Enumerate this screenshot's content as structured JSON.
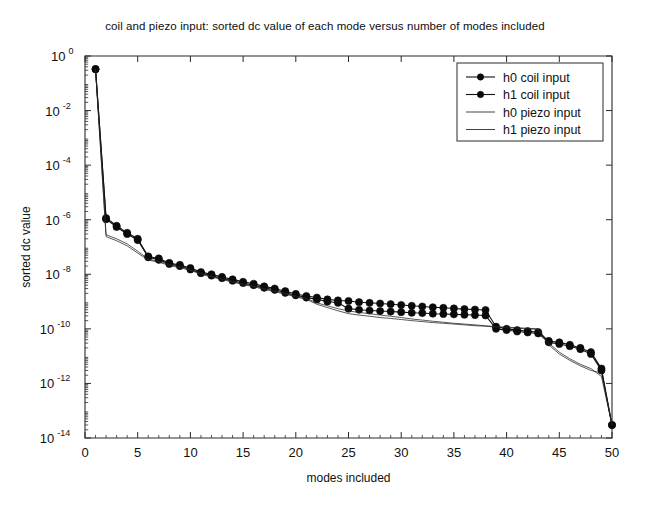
{
  "chart_data": {
    "type": "line",
    "title": "coil and piezo input:  sorted dc value of each mode versus number of modes included",
    "xlabel": "modes included",
    "ylabel": "sorted dc value",
    "xscale": "linear",
    "yscale": "log",
    "xlim": [
      0,
      50
    ],
    "ylim": [
      1e-14,
      1
    ],
    "grid": false,
    "legend_position": "upper-right",
    "xticks": [
      0,
      5,
      10,
      15,
      20,
      25,
      30,
      35,
      40,
      45,
      50
    ],
    "xticklabels": [
      "0",
      "5",
      "10",
      "15",
      "20",
      "25",
      "30",
      "35",
      "40",
      "45",
      "50"
    ],
    "yticks": [
      1,
      0.01,
      0.0001,
      1e-06,
      1e-08,
      1e-10,
      1e-12,
      1e-14
    ],
    "yticklabels": [
      "10^0",
      "10^-2",
      "10^-4",
      "10^-6",
      "10^-8",
      "10^-10",
      "10^-12",
      "10^-14"
    ],
    "ytick_mantissa": [
      "10",
      "10",
      "10",
      "10",
      "10",
      "10",
      "10",
      "10"
    ],
    "ytick_exponent": [
      "0",
      "-2",
      "-4",
      "-6",
      "-8",
      "-10",
      "-12",
      "-14"
    ],
    "x": [
      1,
      2,
      3,
      4,
      5,
      6,
      7,
      8,
      9,
      10,
      11,
      12,
      13,
      14,
      15,
      16,
      17,
      18,
      19,
      20,
      21,
      22,
      23,
      24,
      25,
      26,
      27,
      28,
      29,
      30,
      31,
      32,
      33,
      34,
      35,
      36,
      37,
      38,
      39,
      40,
      41,
      42,
      43,
      44,
      45,
      46,
      47,
      48,
      49,
      50
    ],
    "series": [
      {
        "name": "h0 coil input",
        "marker": "filled-circle",
        "linestyle": "solid",
        "values": [
          0.33,
          1.15e-06,
          6e-07,
          3.3e-07,
          2e-07,
          4.5e-08,
          3.8e-08,
          2.6e-08,
          2.2e-08,
          1.7e-08,
          1.2e-08,
          1e-08,
          8e-09,
          6.5e-09,
          5.3e-09,
          4.5e-09,
          3.6e-09,
          3e-09,
          2.4e-09,
          1.9e-09,
          1.6e-09,
          1.4e-09,
          1.2e-09,
          1.1e-09,
          1.05e-09,
          9.5e-10,
          9e-10,
          8.5e-10,
          8e-10,
          7.5e-10,
          7e-10,
          6.6e-10,
          6.2e-10,
          5.9e-10,
          5.6e-10,
          5.3e-10,
          5.1e-10,
          4.9e-10,
          1.2e-10,
          1e-10,
          9e-11,
          8.2e-11,
          7.6e-11,
          3.6e-11,
          3.2e-11,
          2.6e-11,
          2e-11,
          1.4e-11,
          3.5e-12,
          3e-14
        ]
      },
      {
        "name": "h1 coil input",
        "marker": "filled-circle",
        "linestyle": "solid",
        "values": [
          0.33,
          1.05e-06,
          5.4e-07,
          3e-07,
          1.8e-07,
          4.2e-08,
          3.4e-08,
          2.4e-08,
          2e-08,
          1.5e-08,
          1.1e-08,
          9e-09,
          7.2e-09,
          5.8e-09,
          4.8e-09,
          4e-09,
          3.2e-09,
          2.7e-09,
          2.1e-09,
          1.7e-09,
          1.4e-09,
          1.2e-09,
          1e-09,
          9e-10,
          5.5e-10,
          5e-10,
          4.7e-10,
          4.5e-10,
          4.3e-10,
          4.1e-10,
          3.9e-10,
          3.8e-10,
          3.6e-10,
          3.5e-10,
          3.4e-10,
          3.3e-10,
          3.2e-10,
          3.1e-10,
          1e-10,
          9e-11,
          8e-11,
          7.4e-11,
          6.8e-11,
          3.2e-11,
          2.8e-11,
          2.3e-11,
          1.8e-11,
          1.2e-11,
          3e-12,
          3e-14
        ]
      },
      {
        "name": "h0 piezo input",
        "marker": "none",
        "linestyle": "solid",
        "values": [
          0.33,
          2.8e-07,
          2e-07,
          1.3e-07,
          7e-08,
          3.6e-08,
          3e-08,
          2.3e-08,
          1.9e-08,
          1.5e-08,
          1.1e-08,
          8.5e-09,
          6.8e-09,
          5.5e-09,
          4.4e-09,
          3.7e-09,
          3e-09,
          2.5e-09,
          2e-09,
          1.6e-09,
          1.3e-09,
          9e-10,
          7e-10,
          5.5e-10,
          4.5e-10,
          4e-10,
          3.6e-10,
          3.2e-10,
          2.9e-10,
          2.6e-10,
          2.3e-10,
          2.1e-10,
          1.9e-10,
          1.75e-10,
          1.6e-10,
          1.5e-10,
          1.4e-10,
          1.3e-10,
          1.2e-10,
          1.15e-10,
          1.1e-10,
          1.05e-10,
          1e-10,
          3e-11,
          1.4e-11,
          8e-12,
          5e-12,
          3.5e-12,
          1.8e-12,
          3e-14
        ]
      },
      {
        "name": "h1 piezo input",
        "marker": "none",
        "linestyle": "solid",
        "values": [
          0.33,
          2.4e-07,
          1.7e-07,
          1.1e-07,
          6e-08,
          3.3e-08,
          2.8e-08,
          2.1e-08,
          1.75e-08,
          1.4e-08,
          1e-08,
          8e-09,
          6.4e-09,
          5.2e-09,
          4.2e-09,
          3.5e-09,
          2.8e-09,
          2.3e-09,
          1.85e-09,
          1.5e-09,
          1.2e-09,
          8e-10,
          6e-10,
          4.6e-10,
          3.6e-10,
          3.2e-10,
          2.9e-10,
          2.6e-10,
          2.4e-10,
          2.2e-10,
          2e-10,
          1.85e-10,
          1.7e-10,
          1.6e-10,
          1.5e-10,
          1.4e-10,
          1.3e-10,
          1.25e-10,
          1.15e-10,
          1.1e-10,
          1.05e-10,
          1e-10,
          9.5e-11,
          2.6e-11,
          1.2e-11,
          7e-12,
          4.4e-12,
          3e-12,
          2.4e-12,
          3e-14
        ]
      }
    ],
    "legend": [
      {
        "label": "h0 coil input",
        "marker": "filled-circle",
        "linestyle": "solid"
      },
      {
        "label": "h1 coil input",
        "marker": "filled-circle",
        "linestyle": "solid"
      },
      {
        "label": "h0 piezo input",
        "marker": "none",
        "linestyle": "solid"
      },
      {
        "label": "h1 piezo input",
        "marker": "none",
        "linestyle": "solid"
      }
    ],
    "colors": {
      "line": "#111111",
      "axis": "#2b2b2b",
      "background": "#ffffff",
      "text": "#111111"
    }
  }
}
